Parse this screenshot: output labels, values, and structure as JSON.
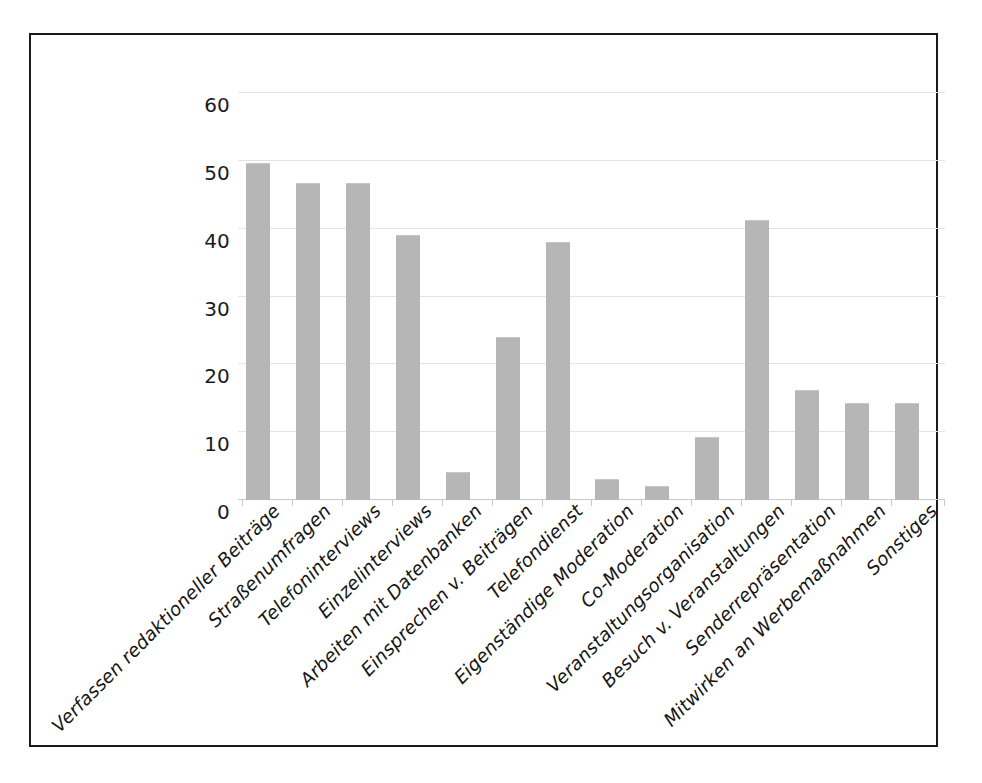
{
  "figure": {
    "frame_color": "#1b1b1b",
    "background": "#ffffff",
    "bar_color": "#b6b6b6",
    "grid_color": "#e3e3e3"
  },
  "chart_data": {
    "type": "bar",
    "title": "",
    "xlabel": "",
    "ylabel": "",
    "ylim": [
      0,
      60
    ],
    "yticks": [
      0,
      10,
      20,
      30,
      40,
      50,
      60
    ],
    "ytick_labels": [
      "0",
      "10",
      "20",
      "30",
      "40",
      "50",
      "60"
    ],
    "grid": true,
    "grid_axis": "y",
    "legend": false,
    "orientation": "vertical",
    "categories": [
      "Verfassen redaktioneller Beiträge",
      "Straßenumfragen",
      "Telefoninterviews",
      "Einzelinterviews",
      "Arbeiten mit Datenbanken",
      "Einsprechen v. Beiträgen",
      "Telefondienst",
      "Eigenständige Moderation",
      "Co-Moderation",
      "Veranstaltungsorganisation",
      "Besuch v. Veranstaltungen",
      "Senderrepräsentation",
      "Mitwirken an Werbemaßnahmen",
      "Sonstiges"
    ],
    "values": [
      49.7,
      46.7,
      46.7,
      39.0,
      4.1,
      24.1,
      38.1,
      3.1,
      2.1,
      9.3,
      41.3,
      16.2,
      14.3,
      14.3
    ]
  }
}
